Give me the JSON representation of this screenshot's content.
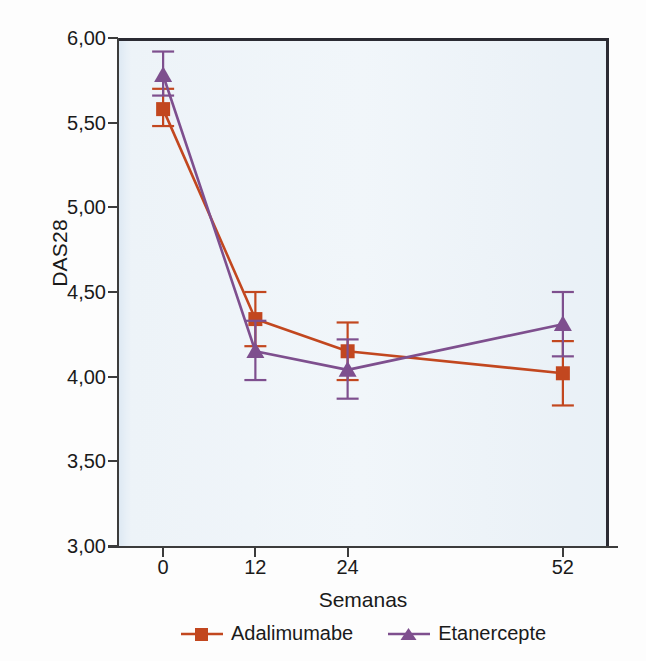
{
  "chart_data": {
    "type": "line",
    "title": "",
    "xlabel": "Semanas",
    "ylabel": "DAS28",
    "categories": [
      "0",
      "12",
      "24",
      "52"
    ],
    "x": [
      0,
      12,
      24,
      52
    ],
    "xlim": [
      -6,
      58
    ],
    "ylim": [
      3.0,
      6.0
    ],
    "ytick_labels": [
      "6,00",
      "5,50",
      "5,00",
      "4,50",
      "4,00",
      "3,50",
      "3,00"
    ],
    "ytick_values": [
      6.0,
      5.5,
      5.0,
      4.5,
      4.0,
      3.5,
      3.0
    ],
    "xtick_labels": [
      "0",
      "12",
      "24",
      "52"
    ],
    "grid": false,
    "legend_position": "bottom-center",
    "error_bars": "vertical, capped",
    "series": [
      {
        "name": "Adalimumabe",
        "color": "#C2471F",
        "marker": "square",
        "values": [
          5.58,
          4.34,
          4.15,
          4.02
        ],
        "err_low": [
          5.48,
          4.18,
          3.98,
          3.83
        ],
        "err_high": [
          5.7,
          4.5,
          4.32,
          4.21
        ]
      },
      {
        "name": "Etanercepte",
        "color": "#7E4F8E",
        "marker": "triangle",
        "values": [
          5.78,
          4.15,
          4.04,
          4.31
        ],
        "err_low": [
          5.66,
          3.98,
          3.87,
          4.12
        ],
        "err_high": [
          5.92,
          4.33,
          4.22,
          4.5
        ]
      }
    ]
  },
  "legend": {
    "entries": [
      {
        "label": "Adalimumabe"
      },
      {
        "label": "Etanercepte"
      }
    ]
  },
  "colors": {
    "series_adalimumabe": "#C2471F",
    "series_etanercepte": "#7E4F8E",
    "plot_background": "#EEF5FA",
    "axis": "#3C3C3C",
    "text": "#1A1A1A"
  }
}
